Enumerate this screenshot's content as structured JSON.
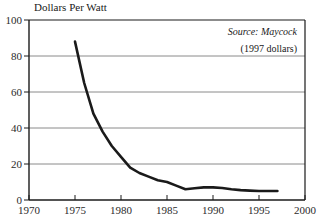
{
  "chart_data": {
    "type": "line",
    "title": "Dollars Per Watt",
    "xlabel": "",
    "ylabel": "Dollars Per Watt",
    "xlim": [
      1970,
      2000
    ],
    "ylim": [
      0,
      100
    ],
    "grid": true,
    "legend_position": "none",
    "xticks": [
      "1970",
      "1975",
      "1980",
      "1985",
      "1990",
      "1995",
      "2000"
    ],
    "xtick_values": [
      1970,
      1975,
      1980,
      1985,
      1990,
      1995,
      2000
    ],
    "yticks": [
      "0",
      "20",
      "40",
      "60",
      "80",
      "100"
    ],
    "ytick_values": [
      0,
      20,
      40,
      60,
      80,
      100
    ],
    "annotations": [
      {
        "text": "Source: Maycock",
        "style": "italic",
        "align": "right"
      },
      {
        "text": "(1997 dollars)",
        "style": "normal",
        "align": "right"
      }
    ],
    "series": [
      {
        "name": "Dollars Per Watt",
        "color": "#1a1a1a",
        "x": [
          1975,
          1976,
          1977,
          1978,
          1979,
          1980,
          1981,
          1982,
          1983,
          1984,
          1985,
          1986,
          1987,
          1988,
          1989,
          1990,
          1991,
          1992,
          1993,
          1994,
          1995,
          1996,
          1997
        ],
        "values": [
          88,
          65,
          48,
          38,
          30,
          24,
          18,
          15,
          13,
          11,
          10,
          8,
          6,
          6.5,
          7,
          7,
          6.7,
          6,
          5.5,
          5.2,
          5,
          5,
          5
        ]
      }
    ]
  },
  "colors": {
    "line": "#1a1a1a",
    "grid": "#8a8a8a",
    "axis": "#1a1a1a",
    "background": "#ffffff"
  }
}
